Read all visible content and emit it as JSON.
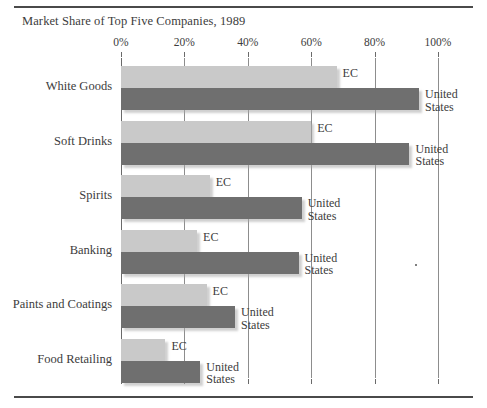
{
  "chart_data": {
    "type": "bar",
    "orientation": "horizontal",
    "title": "Market Share of Top Five Companies, 1989",
    "xlabel": "",
    "ylabel": "",
    "xlim": [
      0,
      100
    ],
    "grid": true,
    "legend_position": "inline-end-of-bar",
    "tick_labels": [
      "0%",
      "20%",
      "40%",
      "60%",
      "80%",
      "100%"
    ],
    "tick_values": [
      0,
      20,
      40,
      60,
      80,
      100
    ],
    "categories": [
      "White Goods",
      "Soft Drinks",
      "Spirits",
      "Banking",
      "Paints and Coatings",
      "Food Retailing"
    ],
    "series": [
      {
        "name": "EC",
        "color": "#c9c9c9",
        "values": [
          68,
          60,
          28,
          24,
          27,
          14
        ]
      },
      {
        "name": "United States",
        "color": "#6f6f6f",
        "values": [
          94,
          91,
          57,
          56,
          36,
          25
        ]
      }
    ]
  },
  "series_labels": {
    "ec": "EC",
    "us_line1": "United",
    "us_line2": "States"
  }
}
